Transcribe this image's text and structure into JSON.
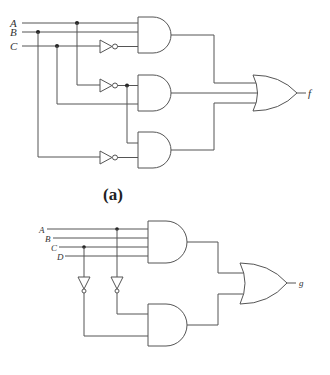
{
  "figure_a": {
    "caption": "(a)",
    "inputs": [
      "A",
      "B",
      "C"
    ],
    "output": "f",
    "gates": {
      "and_gates": 3,
      "or_gates": 1,
      "not_gates": 3
    }
  },
  "figure_b": {
    "inputs": [
      "A",
      "B",
      "C",
      "D"
    ],
    "output": "g",
    "gates": {
      "and_gates": 2,
      "or_gates": 1,
      "not_gates": 2
    }
  },
  "colors": {
    "wire": "#555555",
    "background": "#ffffff"
  }
}
